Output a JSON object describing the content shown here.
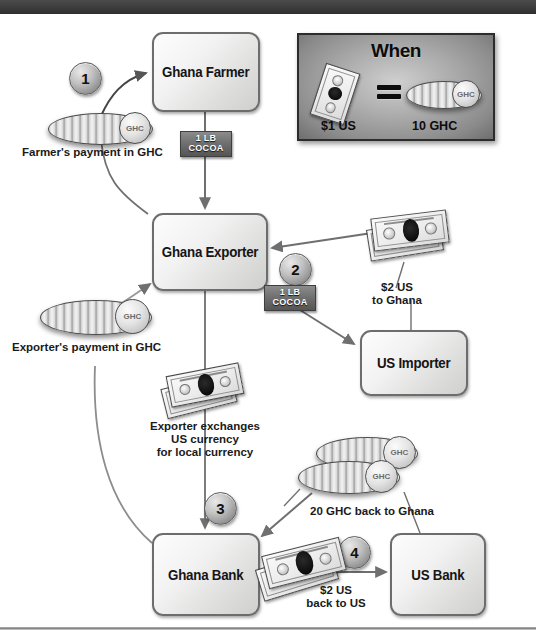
{
  "diagram": {
    "nodes": [
      {
        "id": "ghana-farmer",
        "label": "Ghana Farmer"
      },
      {
        "id": "ghana-exporter",
        "label": "Ghana Exporter"
      },
      {
        "id": "us-importer",
        "label": "US Importer"
      },
      {
        "id": "ghana-bank",
        "label": "Ghana Bank"
      },
      {
        "id": "us-bank",
        "label": "US Bank"
      }
    ],
    "steps": [
      {
        "number": "1"
      },
      {
        "number": "2"
      },
      {
        "number": "3"
      },
      {
        "number": "4"
      }
    ],
    "goods": [
      {
        "id": "cocoa-farmer-to-exporter",
        "line1": "1 LB",
        "line2": "COCOA"
      },
      {
        "id": "cocoa-exporter-to-importer",
        "line1": "1 LB",
        "line2": "COCOA"
      }
    ],
    "captions": [
      {
        "id": "farmers-payment",
        "text": "Farmer's payment in GHC"
      },
      {
        "id": "exporters-payment",
        "text": "Exporter's payment in GHC"
      },
      {
        "id": "usd-to-ghana-l1",
        "text": "$2 US"
      },
      {
        "id": "usd-to-ghana-l2",
        "text": "to Ghana"
      },
      {
        "id": "exchange-l1",
        "text": "Exporter exchanges"
      },
      {
        "id": "exchange-l2",
        "text": "US currency"
      },
      {
        "id": "exchange-l3",
        "text": "for local currency"
      },
      {
        "id": "ghc-back-to-ghana",
        "text": "20 GHC back to Ghana"
      },
      {
        "id": "usd-back-l1",
        "text": "$2 US"
      },
      {
        "id": "usd-back-l2",
        "text": "back to US"
      }
    ],
    "coin_label": "GHC",
    "rate_panel": {
      "title": "When",
      "equals_symbol": "=",
      "left_value": "$1 US",
      "right_value": "10 GHC",
      "coin_label": "GHC"
    },
    "colors": {
      "top_bar": "#3c3c3c",
      "node_border": "#6d6d6d",
      "cocoa_chip": "#6e6e6e",
      "link_stroke": "#6f6f6f",
      "text": "#151515"
    }
  }
}
